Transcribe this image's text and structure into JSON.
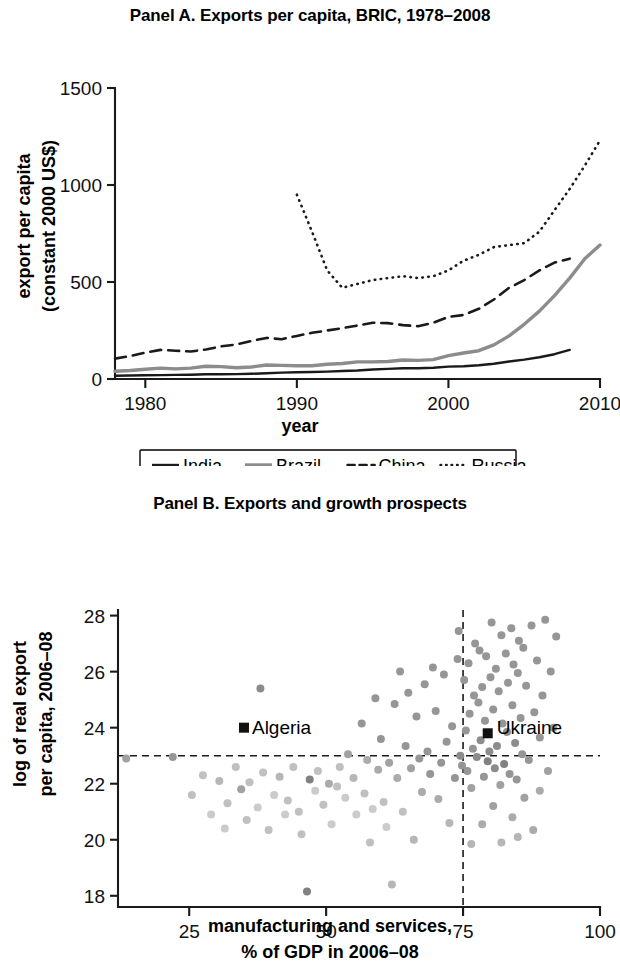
{
  "figure": {
    "panels": [
      {
        "id": "panel-a",
        "title": "Panel A. Exports per capita, BRIC, 1978–2008"
      },
      {
        "id": "panel-b",
        "title": "Panel B. Exports and growth prospects"
      }
    ]
  },
  "panel_a": {
    "title": "Panel A. Exports per capita, BRIC, 1978–2008",
    "xlabel": "year",
    "ylabel_line1": "export per capita",
    "ylabel_line2": "(constant 2000 US$)",
    "xticks": [
      "1980",
      "1990",
      "2000",
      "2010"
    ],
    "yticks": [
      "0",
      "500",
      "1000",
      "1500"
    ],
    "legend": [
      {
        "label": "India",
        "style": "solid",
        "color": "#1a1a1a",
        "width": 2.4
      },
      {
        "label": "Brazil",
        "style": "solid",
        "color": "#8c8c8c",
        "width": 3.4
      },
      {
        "label": "China",
        "style": "dashed",
        "color": "#1a1a1a",
        "width": 2.6
      },
      {
        "label": "Russia",
        "style": "dotted",
        "color": "#1a1a1a",
        "width": 2.6
      }
    ]
  },
  "panel_b": {
    "title": "Panel B. Exports and growth prospects",
    "xlabel_line1": "manufacturing and services,",
    "xlabel_line2": "% of GDP in 2006–08",
    "ylabel_line1": "log of real export",
    "ylabel_line2": "per capita, 2006–08",
    "xticks": [
      "25",
      "50",
      "75",
      "100"
    ],
    "yticks": [
      "18",
      "20",
      "22",
      "24",
      "26",
      "28"
    ],
    "annotations": [
      {
        "name": "Algeria",
        "x": 35.0,
        "y": 24.0,
        "label_dx": 8,
        "label_dy": 6
      },
      {
        "name": "Ukraine",
        "x": 79.5,
        "y": 23.8,
        "label_dx": 9,
        "label_dy": 1
      }
    ]
  },
  "chart_data": [
    {
      "type": "line",
      "id": "panel-a",
      "title": "Panel A. Exports per capita, BRIC, 1978–2008",
      "xlabel": "year",
      "ylabel": "export per capita (constant 2000 US$)",
      "xlim": [
        1978,
        2010
      ],
      "ylim": [
        0,
        1500
      ],
      "xticks": [
        1980,
        1990,
        2000,
        2010
      ],
      "yticks": [
        0,
        500,
        1000,
        1500
      ],
      "grid": false,
      "legend_position": "below-axes",
      "x": [
        1978,
        1979,
        1980,
        1981,
        1982,
        1983,
        1984,
        1985,
        1986,
        1987,
        1988,
        1989,
        1990,
        1991,
        1992,
        1993,
        1994,
        1995,
        1996,
        1997,
        1998,
        1999,
        2000,
        2001,
        2002,
        2003,
        2004,
        2005,
        2006,
        2007,
        2008
      ],
      "series": [
        {
          "name": "India",
          "style": "solid",
          "color": "#1a1a1a",
          "values": [
            17,
            18,
            19,
            20,
            21,
            22,
            24,
            24,
            25,
            27,
            30,
            33,
            35,
            36,
            38,
            41,
            44,
            49,
            52,
            55,
            55,
            58,
            64,
            66,
            71,
            79,
            90,
            100,
            112,
            128,
            150
          ]
        },
        {
          "name": "Brazil",
          "style": "solid",
          "color": "#8c8c8c",
          "values": [
            40,
            44,
            50,
            56,
            52,
            56,
            66,
            64,
            58,
            62,
            72,
            70,
            68,
            68,
            76,
            80,
            88,
            88,
            90,
            98,
            96,
            100,
            120,
            134,
            146,
            176,
            222,
            282,
            350,
            430,
            520,
            620,
            690,
            750,
            690
          ]
        },
        {
          "name": "China",
          "style": "dashed",
          "color": "#1a1a1a",
          "values": [
            105,
            118,
            136,
            150,
            146,
            142,
            152,
            168,
            178,
            196,
            212,
            205,
            222,
            238,
            250,
            262,
            276,
            290,
            288,
            278,
            272,
            290,
            320,
            330,
            362,
            410,
            470,
            510,
            560,
            600,
            620
          ]
        },
        {
          "name": "Russia",
          "style": "dotted",
          "color": "#1a1a1a",
          "x_start": 1990,
          "values": [
            950,
            760,
            560,
            470,
            490,
            510,
            520,
            530,
            520,
            530,
            560,
            610,
            640,
            680,
            690,
            700,
            760,
            870,
            980,
            1100,
            1230,
            1330,
            1420,
            1425
          ]
        }
      ]
    },
    {
      "type": "scatter",
      "id": "panel-b",
      "title": "Panel B. Exports and growth prospects",
      "xlabel": "manufacturing and services, % of GDP in 2006–08",
      "ylabel": "log of real export per capita, 2006–08",
      "xlim": [
        12,
        100
      ],
      "ylim": [
        17.6,
        28.2
      ],
      "xticks": [
        25,
        50,
        75,
        100
      ],
      "yticks": [
        18,
        20,
        22,
        24,
        26,
        28
      ],
      "grid": false,
      "reference_lines": [
        {
          "orientation": "vertical",
          "value": 75,
          "style": "dashed"
        },
        {
          "orientation": "horizontal",
          "value": 23,
          "style": "dashed"
        }
      ],
      "annotations": [
        {
          "name": "Algeria",
          "x": 35.0,
          "y": 24.0
        },
        {
          "name": "Ukraine",
          "x": 79.5,
          "y": 23.8
        }
      ],
      "points": [
        [
          13.5,
          22.9,
          0.45
        ],
        [
          22.0,
          22.95,
          0.5
        ],
        [
          25.5,
          21.6,
          0.3
        ],
        [
          27.5,
          22.3,
          0.3
        ],
        [
          29.0,
          20.9,
          0.25
        ],
        [
          30.5,
          22.1,
          0.35
        ],
        [
          31.5,
          20.4,
          0.25
        ],
        [
          32.0,
          21.3,
          0.3
        ],
        [
          33.5,
          22.6,
          0.3
        ],
        [
          34.5,
          21.8,
          0.45
        ],
        [
          35.5,
          20.7,
          0.3
        ],
        [
          36.0,
          22.05,
          0.3
        ],
        [
          37.5,
          21.15,
          0.25
        ],
        [
          38.0,
          25.4,
          0.55
        ],
        [
          38.5,
          22.4,
          0.3
        ],
        [
          39.5,
          20.35,
          0.3
        ],
        [
          40.5,
          21.6,
          0.25
        ],
        [
          41.5,
          22.25,
          0.35
        ],
        [
          42.5,
          20.9,
          0.25
        ],
        [
          43.0,
          21.4,
          0.3
        ],
        [
          44.0,
          22.6,
          0.3
        ],
        [
          45.0,
          21.0,
          0.3
        ],
        [
          45.5,
          20.2,
          0.3
        ],
        [
          46.5,
          18.15,
          0.6
        ],
        [
          47.0,
          22.15,
          0.6
        ],
        [
          48.0,
          21.75,
          0.25
        ],
        [
          48.5,
          22.45,
          0.3
        ],
        [
          49.5,
          21.25,
          0.3
        ],
        [
          50.5,
          22.0,
          0.4
        ],
        [
          51.0,
          20.55,
          0.25
        ],
        [
          52.0,
          21.9,
          0.3
        ],
        [
          52.5,
          22.6,
          0.3
        ],
        [
          53.5,
          21.5,
          0.25
        ],
        [
          54.0,
          23.05,
          0.45
        ],
        [
          55.0,
          22.2,
          0.35
        ],
        [
          55.5,
          20.9,
          0.25
        ],
        [
          56.5,
          24.15,
          0.5
        ],
        [
          57.0,
          21.65,
          0.3
        ],
        [
          57.5,
          22.85,
          0.4
        ],
        [
          58.0,
          19.9,
          0.3
        ],
        [
          58.5,
          21.1,
          0.25
        ],
        [
          59.0,
          25.05,
          0.5
        ],
        [
          59.5,
          22.5,
          0.4
        ],
        [
          60.0,
          23.6,
          0.5
        ],
        [
          60.5,
          21.35,
          0.3
        ],
        [
          61.0,
          20.45,
          0.25
        ],
        [
          61.5,
          22.75,
          0.45
        ],
        [
          62.0,
          18.4,
          0.35
        ],
        [
          62.5,
          24.85,
          0.5
        ],
        [
          63.0,
          22.2,
          0.4
        ],
        [
          63.5,
          26.0,
          0.5
        ],
        [
          64.0,
          21.0,
          0.3
        ],
        [
          64.5,
          23.35,
          0.5
        ],
        [
          65.0,
          25.25,
          0.5
        ],
        [
          65.5,
          22.55,
          0.45
        ],
        [
          66.0,
          20.0,
          0.35
        ],
        [
          66.5,
          24.4,
          0.5
        ],
        [
          67.0,
          22.9,
          0.5
        ],
        [
          67.5,
          21.7,
          0.4
        ],
        [
          68.0,
          25.55,
          0.5
        ],
        [
          68.5,
          23.15,
          0.5
        ],
        [
          69.0,
          22.35,
          0.5
        ],
        [
          69.5,
          26.15,
          0.5
        ],
        [
          70.0,
          24.6,
          0.5
        ],
        [
          70.5,
          21.45,
          0.4
        ],
        [
          71.0,
          22.75,
          0.5
        ],
        [
          71.5,
          25.9,
          0.5
        ],
        [
          72.0,
          23.5,
          0.5
        ],
        [
          72.5,
          20.6,
          0.35
        ],
        [
          73.0,
          24.05,
          0.5
        ],
        [
          73.5,
          22.2,
          0.5
        ],
        [
          74.0,
          26.45,
          0.5
        ],
        [
          74.2,
          27.45,
          0.5
        ],
        [
          74.5,
          23.0,
          0.55
        ],
        [
          74.8,
          22.65,
          0.5
        ],
        [
          75.2,
          25.7,
          0.5
        ],
        [
          75.5,
          23.9,
          0.5
        ],
        [
          75.8,
          22.45,
          0.5
        ],
        [
          76.0,
          26.3,
          0.5
        ],
        [
          76.2,
          24.5,
          0.5
        ],
        [
          76.5,
          21.85,
          0.45
        ],
        [
          76.8,
          23.25,
          0.5
        ],
        [
          77.0,
          25.15,
          0.5
        ],
        [
          77.2,
          27.0,
          0.5
        ],
        [
          77.5,
          22.95,
          0.55
        ],
        [
          77.8,
          24.9,
          0.5
        ],
        [
          78.0,
          26.75,
          0.5
        ],
        [
          78.2,
          23.55,
          0.55
        ],
        [
          78.5,
          25.45,
          0.5
        ],
        [
          78.8,
          22.25,
          0.5
        ],
        [
          79.0,
          24.25,
          0.5
        ],
        [
          79.2,
          26.55,
          0.5
        ],
        [
          79.5,
          22.8,
          0.6
        ],
        [
          79.8,
          23.15,
          0.55
        ],
        [
          80.0,
          25.8,
          0.5
        ],
        [
          80.2,
          27.75,
          0.5
        ],
        [
          80.5,
          24.65,
          0.5
        ],
        [
          80.8,
          22.55,
          0.55
        ],
        [
          81.0,
          26.1,
          0.5
        ],
        [
          81.2,
          23.35,
          0.55
        ],
        [
          81.5,
          25.3,
          0.5
        ],
        [
          81.8,
          21.95,
          0.45
        ],
        [
          82.0,
          27.3,
          0.5
        ],
        [
          82.2,
          24.15,
          0.5
        ],
        [
          82.5,
          22.7,
          0.6
        ],
        [
          82.8,
          26.65,
          0.5
        ],
        [
          83.0,
          23.85,
          0.55
        ],
        [
          83.2,
          25.6,
          0.5
        ],
        [
          83.5,
          22.35,
          0.5
        ],
        [
          83.8,
          27.55,
          0.5
        ],
        [
          84.0,
          24.8,
          0.5
        ],
        [
          84.2,
          26.25,
          0.5
        ],
        [
          84.5,
          23.45,
          0.55
        ],
        [
          84.8,
          22.15,
          0.5
        ],
        [
          85.0,
          25.95,
          0.5
        ],
        [
          85.2,
          27.1,
          0.5
        ],
        [
          85.5,
          24.35,
          0.5
        ],
        [
          85.8,
          23.05,
          0.5
        ],
        [
          86.0,
          26.85,
          0.5
        ],
        [
          86.5,
          25.5,
          0.5
        ],
        [
          87.0,
          22.85,
          0.5
        ],
        [
          87.5,
          27.65,
          0.5
        ],
        [
          88.0,
          24.55,
          0.5
        ],
        [
          88.5,
          26.4,
          0.5
        ],
        [
          89.0,
          23.65,
          0.5
        ],
        [
          89.5,
          25.15,
          0.5
        ],
        [
          90.0,
          27.85,
          0.5
        ],
        [
          90.5,
          22.45,
          0.45
        ],
        [
          91.0,
          26.0,
          0.5
        ],
        [
          91.5,
          24.0,
          0.5
        ],
        [
          92.0,
          27.25,
          0.5
        ],
        [
          86.2,
          21.5,
          0.45
        ],
        [
          84.0,
          20.8,
          0.4
        ],
        [
          82.0,
          19.9,
          0.35
        ],
        [
          87.8,
          20.35,
          0.4
        ],
        [
          80.5,
          21.2,
          0.45
        ],
        [
          78.5,
          20.55,
          0.4
        ],
        [
          76.5,
          19.85,
          0.35
        ],
        [
          89.0,
          21.75,
          0.4
        ],
        [
          85.0,
          20.1,
          0.35
        ]
      ]
    }
  ]
}
